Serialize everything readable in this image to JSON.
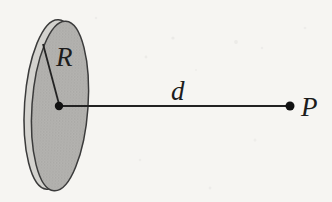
{
  "diagram": {
    "labels": {
      "radius": "R",
      "distance": "d",
      "point": "P"
    },
    "colors": {
      "background": "#f6f5f2",
      "disk_face": "#b5b4b1",
      "disk_face_dots": "#9c9b98",
      "disk_rim": "#d3d2ce",
      "outline": "#3b3b3b",
      "line": "#222222",
      "dot": "#111111",
      "label": "#1c1c1c"
    }
  }
}
